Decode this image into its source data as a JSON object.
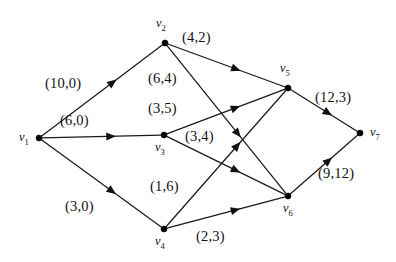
{
  "figure": {
    "kind": "flow-network-diagram",
    "width": 396,
    "height": 262,
    "background": "#ffffff",
    "ink_color": "#111111"
  },
  "nodes": [
    {
      "id": "v1",
      "name": "v",
      "index": "1",
      "x": 39,
      "y": 138,
      "label_x": 19,
      "label_y": 131
    },
    {
      "id": "v2",
      "name": "v",
      "index": "2",
      "x": 165,
      "y": 43,
      "label_x": 156,
      "label_y": 17
    },
    {
      "id": "v3",
      "name": "v",
      "index": "3",
      "x": 164,
      "y": 135,
      "label_x": 155,
      "label_y": 141
    },
    {
      "id": "v4",
      "name": "v",
      "index": "4",
      "x": 164,
      "y": 229,
      "label_x": 155,
      "label_y": 235
    },
    {
      "id": "v5",
      "name": "v",
      "index": "5",
      "x": 288,
      "y": 88,
      "label_x": 280,
      "label_y": 62
    },
    {
      "id": "v6",
      "name": "v",
      "index": "6",
      "x": 288,
      "y": 196,
      "label_x": 283,
      "label_y": 202
    },
    {
      "id": "v7",
      "name": "v",
      "index": "7",
      "x": 360,
      "y": 133,
      "label_x": 370,
      "label_y": 126
    }
  ],
  "edges": [
    {
      "id": "e-v1-v2",
      "from": "v1",
      "to": "v2",
      "capacity": 10,
      "flow": 0,
      "label": "(10,0)",
      "label_x": 45,
      "label_y": 76
    },
    {
      "id": "e-v1-v3",
      "from": "v1",
      "to": "v3",
      "capacity": 6,
      "flow": 0,
      "label": "(6,0)",
      "label_x": 60,
      "label_y": 113
    },
    {
      "id": "e-v1-v4",
      "from": "v1",
      "to": "v4",
      "capacity": 3,
      "flow": 0,
      "label": "(3,0)",
      "label_x": 65,
      "label_y": 199
    },
    {
      "id": "e-v2-v5",
      "from": "v2",
      "to": "v5",
      "capacity": 4,
      "flow": 2,
      "label": "(4,2)",
      "label_x": 182,
      "label_y": 30
    },
    {
      "id": "e-v2-v6",
      "from": "v2",
      "to": "v6",
      "capacity": 6,
      "flow": 4,
      "label": "(6,4)",
      "label_x": 148,
      "label_y": 71
    },
    {
      "id": "e-v3-v5",
      "from": "v3",
      "to": "v5",
      "capacity": 3,
      "flow": 5,
      "label": "(3,5)",
      "label_x": 148,
      "label_y": 101
    },
    {
      "id": "e-v3-v6",
      "from": "v3",
      "to": "v6",
      "capacity": 3,
      "flow": 4,
      "label": "(3,4)",
      "label_x": 185,
      "label_y": 129
    },
    {
      "id": "e-v4-v5",
      "from": "v4",
      "to": "v5",
      "capacity": 1,
      "flow": 6,
      "label": "(1,6)",
      "label_x": 150,
      "label_y": 179
    },
    {
      "id": "e-v4-v6",
      "from": "v4",
      "to": "v6",
      "capacity": 2,
      "flow": 3,
      "label": "(2,3)",
      "label_x": 196,
      "label_y": 229
    },
    {
      "id": "e-v5-v7",
      "from": "v5",
      "to": "v7",
      "capacity": 12,
      "flow": 3,
      "label": "(12,3)",
      "label_x": 315,
      "label_y": 90
    },
    {
      "id": "e-v6-v7",
      "from": "v6",
      "to": "v7",
      "capacity": 9,
      "flow": 12,
      "label": "(9,12)",
      "label_x": 318,
      "label_y": 166
    }
  ]
}
